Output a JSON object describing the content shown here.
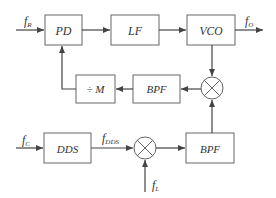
{
  "diagram": {
    "type": "block-diagram",
    "colors": {
      "stroke": "#555555",
      "text": "#333333",
      "background": "#ffffff"
    },
    "blocks": {
      "pd": {
        "label": "PD"
      },
      "lf": {
        "label": "LF"
      },
      "vco": {
        "label": "VCO"
      },
      "bpf_upper": {
        "label": "BPF"
      },
      "divider": {
        "label": "÷ M"
      },
      "dds": {
        "label": "DDS"
      },
      "bpf_lower": {
        "label": "BPF"
      }
    },
    "mixers": [
      {
        "id": "mixer-upper",
        "symbol": "multiply"
      },
      {
        "id": "mixer-lower",
        "symbol": "multiply"
      }
    ],
    "signals": {
      "f_r": {
        "base": "f",
        "sub": "R"
      },
      "f_o": {
        "base": "f",
        "sub": "O"
      },
      "f_c": {
        "base": "f",
        "sub": "C"
      },
      "f_dds": {
        "base": "f",
        "sub": "DDS"
      },
      "f_l": {
        "base": "f",
        "sub": "L"
      }
    },
    "connections": [
      "f_R -> PD",
      "PD -> LF",
      "LF -> VCO",
      "VCO -> f_O",
      "VCO -> mixer-upper",
      "mixer-upper -> BPF(upper)",
      "BPF(upper) -> ÷M",
      "÷M -> PD",
      "f_C -> DDS",
      "DDS -> mixer-lower (f_DDS)",
      "f_L -> mixer-lower",
      "mixer-lower -> BPF(lower)",
      "BPF(lower) -> mixer-upper"
    ]
  }
}
